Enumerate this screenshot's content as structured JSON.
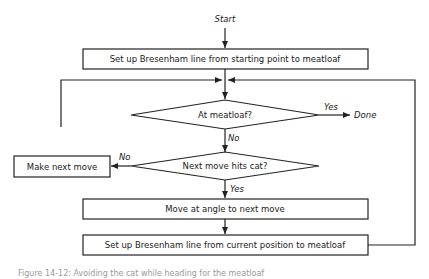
{
  "diagram": {
    "start_label": "Start",
    "box_setup_start": "Set up Bresenham line from starting point to meatloaf",
    "decision_at_meatloaf": "At meatloaf?",
    "yes_label_1": "Yes",
    "done_label": "Done",
    "no_label_1": "No",
    "decision_hits_cat": "Next move hits cat?",
    "no_label_2": "No",
    "box_make_move": "Make next move",
    "yes_label_2": "Yes",
    "box_move_angle": "Move at angle to next move",
    "box_setup_current": "Set up Bresenham line from current position to meatloaf",
    "caption": "Figure 14-12: Avoiding the cat while heading for the meatloaf"
  },
  "colors": {
    "stroke": "#222222",
    "background": "#ffffff"
  }
}
